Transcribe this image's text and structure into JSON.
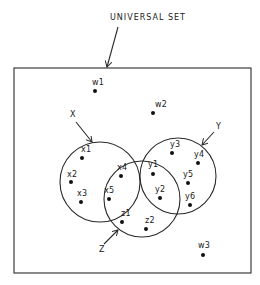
{
  "title": "UNIVERSAL SET",
  "universal_set": {
    "x": 14,
    "y": 68,
    "width": 237,
    "height": 205
  },
  "sets": [
    {
      "name": "X",
      "label": "X",
      "cx": 100,
      "cy": 182,
      "r": 40,
      "label_x": 70,
      "label_y": 117,
      "arrow": [
        76,
        122,
        92,
        142
      ]
    },
    {
      "name": "Y",
      "label": "Y",
      "cx": 178,
      "cy": 176,
      "r": 38,
      "label_x": 216,
      "label_y": 129,
      "arrow": [
        214,
        132,
        202,
        145
      ]
    },
    {
      "name": "Z",
      "label": "Z",
      "cx": 142,
      "cy": 199,
      "r": 38,
      "label_x": 99,
      "label_y": 252,
      "arrow": [
        104,
        244,
        118,
        230
      ]
    }
  ],
  "elements": [
    {
      "label": "w1",
      "x": 95,
      "y": 91,
      "lx": 92,
      "ly": 85
    },
    {
      "label": "w2",
      "x": 153,
      "y": 113,
      "lx": 155,
      "ly": 107
    },
    {
      "label": "w3",
      "x": 203,
      "y": 255,
      "lx": 198,
      "ly": 248
    },
    {
      "label": "x1",
      "x": 82,
      "y": 158,
      "lx": 81,
      "ly": 152
    },
    {
      "label": "x2",
      "x": 71,
      "y": 182,
      "lx": 67,
      "ly": 177
    },
    {
      "label": "x3",
      "x": 81,
      "y": 202,
      "lx": 77,
      "ly": 196
    },
    {
      "label": "x4",
      "x": 121,
      "y": 176,
      "lx": 117,
      "ly": 170
    },
    {
      "label": "x5",
      "x": 109,
      "y": 199,
      "lx": 104,
      "ly": 193
    },
    {
      "label": "y1",
      "x": 153,
      "y": 174,
      "lx": 148,
      "ly": 167
    },
    {
      "label": "y2",
      "x": 160,
      "y": 198,
      "lx": 155,
      "ly": 192
    },
    {
      "label": "y3",
      "x": 172,
      "y": 153,
      "lx": 170,
      "ly": 147
    },
    {
      "label": "y4",
      "x": 198,
      "y": 163,
      "lx": 194,
      "ly": 157
    },
    {
      "label": "y5",
      "x": 188,
      "y": 183,
      "lx": 183,
      "ly": 177
    },
    {
      "label": "y6",
      "x": 190,
      "y": 205,
      "lx": 185,
      "ly": 199
    },
    {
      "label": "z1",
      "x": 122,
      "y": 222,
      "lx": 121,
      "ly": 216
    },
    {
      "label": "z2",
      "x": 146,
      "y": 229,
      "lx": 145,
      "ly": 223
    }
  ],
  "title_arrow": [
    118,
    27,
    107,
    67
  ],
  "colors": {
    "ink": "#1a1a1a",
    "background": "#ffffff"
  }
}
